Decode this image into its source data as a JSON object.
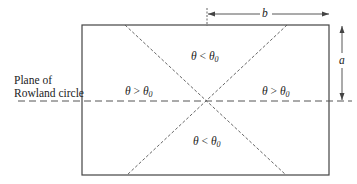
{
  "diagram": {
    "plane_label_line1": "Plane of",
    "plane_label_line2": "Rowland circle",
    "dimension_b": "b",
    "dimension_a": "a",
    "regions": {
      "top": {
        "theta": "θ",
        "op": " < ",
        "theta0": "θ",
        "sub": "0"
      },
      "bottom": {
        "theta": "θ",
        "op": " < ",
        "theta0": "θ",
        "sub": "0"
      },
      "left": {
        "theta": "θ",
        "op": " > ",
        "theta0": "θ",
        "sub": "0"
      },
      "right": {
        "theta": "θ",
        "op": " > ",
        "theta0": "θ",
        "sub": "0"
      }
    },
    "colors": {
      "line": "#444444",
      "dash": "#555555",
      "text": "#222222"
    }
  }
}
